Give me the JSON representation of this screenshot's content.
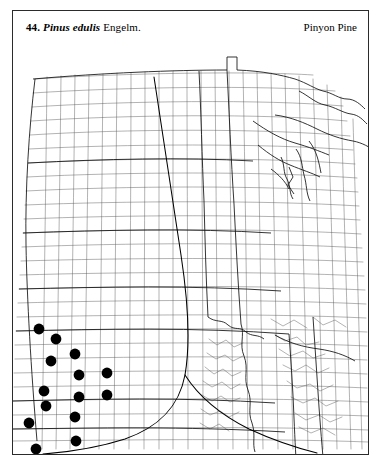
{
  "plate": {
    "number": "44.",
    "scientific_name": "Pinus edulis",
    "authority": "Engelm.",
    "common_name": "Pinyon Pine"
  },
  "map": {
    "kind": "county-dot-distribution-map",
    "region": "central and eastern United States",
    "symbol": "filled-black-circle",
    "symbol_meaning": "county occurrence record",
    "range_line": "curved range boundary arc",
    "line_color": "#000000",
    "county_line_color": "#555555",
    "background_color": "#ffffff"
  },
  "chart_data": {
    "type": "scatter",
    "xlabel": "",
    "ylabel": "",
    "xlim": [
      0,
      355
    ],
    "ylim": [
      0,
      405
    ],
    "grid": false,
    "legend": "none",
    "series": [
      {
        "name": "County occurrence records",
        "marker": "filled-circle",
        "color": "#000000",
        "points": [
          [
            26,
            280
          ],
          [
            43,
            290
          ],
          [
            38,
            312
          ],
          [
            62,
            305
          ],
          [
            66,
            326
          ],
          [
            94,
            324
          ],
          [
            66,
            348
          ],
          [
            94,
            346
          ],
          [
            31,
            342
          ],
          [
            33,
            357
          ],
          [
            62,
            368
          ],
          [
            16,
            374
          ],
          [
            63,
            392
          ],
          [
            23,
            400
          ]
        ]
      }
    ],
    "annotations": [
      {
        "text": "44.",
        "role": "plate-number"
      },
      {
        "text": "Pinus edulis",
        "role": "scientific-name"
      },
      {
        "text": "Engelm.",
        "role": "authority"
      },
      {
        "text": "Pinyon Pine",
        "role": "common-name"
      }
    ]
  }
}
